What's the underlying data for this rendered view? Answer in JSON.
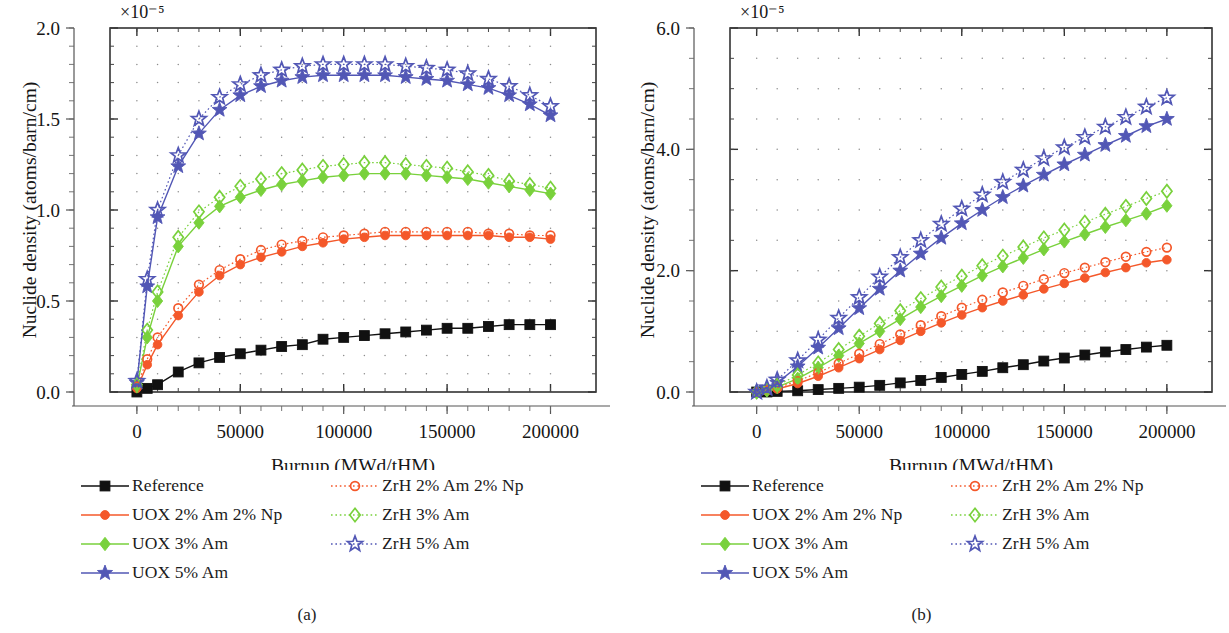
{
  "figure": {
    "panels": [
      {
        "id": "a",
        "caption": "(a)",
        "exponent_label": "×10⁻⁵",
        "axes": {
          "xlabel": "Burnup (MWd/tHM)",
          "ylabel": "Nuclide density (atoms/barn/cm)",
          "xticks": [
            0,
            50000,
            100000,
            150000,
            200000
          ],
          "xtick_labels": [
            "0",
            "50000",
            "100000",
            "150000",
            "200000"
          ],
          "yticks": [
            0.0,
            0.5,
            1.0,
            1.5,
            2.0
          ],
          "ytick_labels": [
            "0.0",
            "0.5",
            "1.0",
            "1.5",
            "2.0"
          ],
          "xlim": [
            -13000,
            222000
          ],
          "ylim": [
            0.0,
            2.0
          ],
          "grid": "dotted",
          "minor_x_divisions": 5,
          "minor_y_divisions": 5
        }
      },
      {
        "id": "b",
        "caption": "(b)",
        "exponent_label": "×10⁻⁵",
        "axes": {
          "xlabel": "Burnup (MWd/tHM)",
          "ylabel": "Nuclide density (atoms/barn/cm)",
          "xticks": [
            0,
            50000,
            100000,
            150000,
            200000
          ],
          "xtick_labels": [
            "0",
            "50000",
            "100000",
            "150000",
            "200000"
          ],
          "yticks": [
            0.0,
            2.0,
            4.0,
            6.0
          ],
          "ytick_labels": [
            "0.0",
            "2.0",
            "4.0",
            "6.0"
          ],
          "xlim": [
            -13000,
            222000
          ],
          "ylim": [
            0.0,
            6.0
          ],
          "grid": "dotted",
          "minor_x_divisions": 5,
          "minor_y_divisions": 4
        }
      }
    ],
    "legend": {
      "items": [
        {
          "label": "Reference",
          "color": "#111111",
          "marker": "square",
          "filled": true,
          "line": "solid",
          "column": 0
        },
        {
          "label": "UOX 2% Am 2% Np",
          "color": "#F4582A",
          "marker": "circle",
          "filled": true,
          "line": "solid",
          "column": 0
        },
        {
          "label": "UOX 3% Am",
          "color": "#79D13C",
          "marker": "diamond",
          "filled": true,
          "line": "solid",
          "column": 0
        },
        {
          "label": "UOX 5% Am",
          "color": "#5257B5",
          "marker": "star",
          "filled": true,
          "line": "solid",
          "column": 0
        },
        {
          "label": "ZrH 2% Am 2% Np",
          "color": "#F4582A",
          "marker": "circle",
          "filled": false,
          "line": "dotted",
          "column": 1
        },
        {
          "label": "ZrH 3% Am",
          "color": "#79D13C",
          "marker": "diamond",
          "filled": false,
          "line": "dotted",
          "column": 1
        },
        {
          "label": "ZrH 5% Am",
          "color": "#5257B5",
          "marker": "star",
          "filled": false,
          "line": "dotted",
          "column": 1
        }
      ]
    }
  },
  "chart_data": [
    {
      "type": "line",
      "panel": "a",
      "title": "",
      "xlabel": "Burnup (MWd/tHM)",
      "ylabel": "Nuclide density (atoms/barn/cm)",
      "y_scale": "×10⁻⁵",
      "xlim": [
        -13000,
        222000
      ],
      "ylim": [
        0.0,
        2.0
      ],
      "grid": true,
      "legend_position": "below",
      "x": [
        0,
        5000,
        10000,
        20000,
        30000,
        40000,
        50000,
        60000,
        70000,
        80000,
        90000,
        100000,
        110000,
        120000,
        130000,
        140000,
        150000,
        160000,
        170000,
        180000,
        190000,
        200000
      ],
      "series": [
        {
          "name": "Reference",
          "color": "#111111",
          "marker": "square",
          "filled": true,
          "line": "solid",
          "values": [
            0.0,
            0.02,
            0.04,
            0.11,
            0.16,
            0.19,
            0.21,
            0.23,
            0.25,
            0.26,
            0.29,
            0.3,
            0.31,
            0.32,
            0.33,
            0.34,
            0.35,
            0.35,
            0.36,
            0.37,
            0.37,
            0.37
          ]
        },
        {
          "name": "UOX 2% Am 2% Np",
          "color": "#F4582A",
          "marker": "circle",
          "filled": true,
          "line": "solid",
          "values": [
            0.02,
            0.15,
            0.26,
            0.42,
            0.55,
            0.64,
            0.7,
            0.74,
            0.77,
            0.8,
            0.82,
            0.84,
            0.85,
            0.86,
            0.86,
            0.86,
            0.86,
            0.86,
            0.86,
            0.85,
            0.85,
            0.84
          ]
        },
        {
          "name": "UOX 3% Am",
          "color": "#79D13C",
          "marker": "diamond",
          "filled": true,
          "line": "solid",
          "values": [
            0.03,
            0.3,
            0.5,
            0.8,
            0.93,
            1.02,
            1.07,
            1.11,
            1.14,
            1.16,
            1.18,
            1.19,
            1.2,
            1.2,
            1.2,
            1.19,
            1.18,
            1.17,
            1.15,
            1.13,
            1.11,
            1.09
          ]
        },
        {
          "name": "UOX 5% Am",
          "color": "#5257B5",
          "marker": "star",
          "filled": true,
          "line": "solid",
          "values": [
            0.05,
            0.58,
            0.96,
            1.24,
            1.42,
            1.55,
            1.63,
            1.68,
            1.71,
            1.73,
            1.74,
            1.74,
            1.74,
            1.74,
            1.73,
            1.72,
            1.71,
            1.69,
            1.67,
            1.63,
            1.58,
            1.52
          ]
        },
        {
          "name": "ZrH 2% Am 2% Np",
          "color": "#F4582A",
          "marker": "circle",
          "filled": false,
          "line": "dotted",
          "values": [
            0.03,
            0.18,
            0.3,
            0.46,
            0.59,
            0.67,
            0.73,
            0.78,
            0.81,
            0.83,
            0.85,
            0.86,
            0.87,
            0.88,
            0.88,
            0.88,
            0.88,
            0.88,
            0.87,
            0.87,
            0.86,
            0.86
          ]
        },
        {
          "name": "ZrH 3% Am",
          "color": "#79D13C",
          "marker": "diamond",
          "filled": false,
          "line": "dotted",
          "values": [
            0.04,
            0.34,
            0.55,
            0.85,
            0.99,
            1.07,
            1.13,
            1.17,
            1.2,
            1.22,
            1.24,
            1.25,
            1.26,
            1.26,
            1.25,
            1.24,
            1.23,
            1.21,
            1.19,
            1.16,
            1.14,
            1.12
          ]
        },
        {
          "name": "ZrH 5% Am",
          "color": "#5257B5",
          "marker": "star",
          "filled": false,
          "line": "dotted",
          "values": [
            0.06,
            0.62,
            1.0,
            1.3,
            1.5,
            1.62,
            1.69,
            1.74,
            1.77,
            1.79,
            1.8,
            1.8,
            1.8,
            1.8,
            1.79,
            1.78,
            1.77,
            1.75,
            1.72,
            1.68,
            1.63,
            1.57
          ]
        }
      ]
    },
    {
      "type": "line",
      "panel": "b",
      "title": "",
      "xlabel": "Burnup (MWd/tHM)",
      "ylabel": "Nuclide density (atoms/barn/cm)",
      "y_scale": "×10⁻⁵",
      "xlim": [
        -13000,
        222000
      ],
      "ylim": [
        0.0,
        6.0
      ],
      "grid": true,
      "legend_position": "below",
      "x": [
        0,
        5000,
        10000,
        20000,
        30000,
        40000,
        50000,
        60000,
        70000,
        80000,
        90000,
        100000,
        110000,
        120000,
        130000,
        140000,
        150000,
        160000,
        170000,
        180000,
        190000,
        200000
      ],
      "series": [
        {
          "name": "Reference",
          "color": "#111111",
          "marker": "square",
          "filled": true,
          "line": "solid",
          "values": [
            0.0,
            0.0,
            0.01,
            0.02,
            0.04,
            0.06,
            0.08,
            0.11,
            0.15,
            0.19,
            0.24,
            0.29,
            0.34,
            0.4,
            0.45,
            0.51,
            0.56,
            0.61,
            0.66,
            0.7,
            0.74,
            0.77
          ]
        },
        {
          "name": "UOX 2% Am 2% Np",
          "color": "#F4582A",
          "marker": "circle",
          "filled": true,
          "line": "solid",
          "values": [
            0.0,
            0.02,
            0.05,
            0.14,
            0.26,
            0.4,
            0.55,
            0.7,
            0.85,
            1.0,
            1.14,
            1.27,
            1.39,
            1.5,
            1.6,
            1.7,
            1.79,
            1.88,
            1.97,
            2.05,
            2.13,
            2.18
          ]
        },
        {
          "name": "UOX 3% Am",
          "color": "#79D13C",
          "marker": "diamond",
          "filled": true,
          "line": "solid",
          "values": [
            0.0,
            0.03,
            0.08,
            0.22,
            0.4,
            0.6,
            0.8,
            1.0,
            1.2,
            1.4,
            1.58,
            1.75,
            1.92,
            2.07,
            2.21,
            2.35,
            2.48,
            2.6,
            2.72,
            2.83,
            2.94,
            3.07
          ]
        },
        {
          "name": "UOX 5% Am",
          "color": "#5257B5",
          "marker": "star",
          "filled": true,
          "line": "solid",
          "values": [
            0.0,
            0.05,
            0.15,
            0.42,
            0.73,
            1.05,
            1.38,
            1.7,
            2.0,
            2.28,
            2.54,
            2.78,
            3.0,
            3.21,
            3.4,
            3.58,
            3.75,
            3.91,
            4.07,
            4.22,
            4.38,
            4.5
          ]
        },
        {
          "name": "ZrH 2% Am 2% Np",
          "color": "#F4582A",
          "marker": "circle",
          "filled": false,
          "line": "dotted",
          "values": [
            0.0,
            0.03,
            0.07,
            0.18,
            0.32,
            0.47,
            0.63,
            0.79,
            0.95,
            1.1,
            1.25,
            1.39,
            1.52,
            1.64,
            1.75,
            1.86,
            1.96,
            2.05,
            2.14,
            2.23,
            2.31,
            2.38
          ]
        },
        {
          "name": "ZrH 3% Am",
          "color": "#79D13C",
          "marker": "diamond",
          "filled": false,
          "line": "dotted",
          "values": [
            0.0,
            0.04,
            0.11,
            0.28,
            0.48,
            0.7,
            0.92,
            1.13,
            1.34,
            1.54,
            1.73,
            1.91,
            2.08,
            2.24,
            2.39,
            2.54,
            2.67,
            2.8,
            2.93,
            3.06,
            3.19,
            3.31
          ]
        },
        {
          "name": "ZrH 5% Am",
          "color": "#5257B5",
          "marker": "star",
          "filled": false,
          "line": "dotted",
          "values": [
            0.0,
            0.07,
            0.2,
            0.52,
            0.86,
            1.22,
            1.56,
            1.9,
            2.22,
            2.5,
            2.77,
            3.02,
            3.25,
            3.46,
            3.66,
            3.85,
            4.03,
            4.2,
            4.37,
            4.53,
            4.7,
            4.85
          ]
        }
      ]
    }
  ]
}
